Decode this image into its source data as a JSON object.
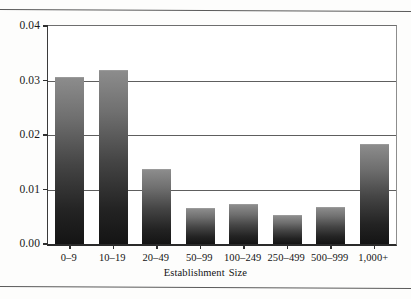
{
  "chart_data": {
    "type": "bar",
    "title": "",
    "xlabel": "Establishment Size",
    "ylabel": "",
    "categories": [
      "0–9",
      "10–19",
      "20–49",
      "50–99",
      "100–249",
      "250–499",
      "500–999",
      "1,000+"
    ],
    "values": [
      0.0304,
      0.0317,
      0.0135,
      0.0064,
      0.0071,
      0.0051,
      0.0066,
      0.0182
    ],
    "ylim": [
      0.0,
      0.04
    ],
    "ytick_labels": [
      "0.00",
      "0.01",
      "0.02",
      "0.03",
      "0.04"
    ],
    "ytick_values": [
      0.0,
      0.01,
      0.02,
      0.03,
      0.04
    ],
    "grid": true,
    "legend": "none",
    "series_name": "",
    "bar_fill_top_color": "#8c8c8c",
    "bar_fill_bottom_color": "#141414",
    "axis_color": "#2f2f2f",
    "gridline_color": "#5e5e5e",
    "background_color": "#ffffff"
  },
  "figure": {
    "top_rule": "",
    "bottom_rule": ""
  }
}
